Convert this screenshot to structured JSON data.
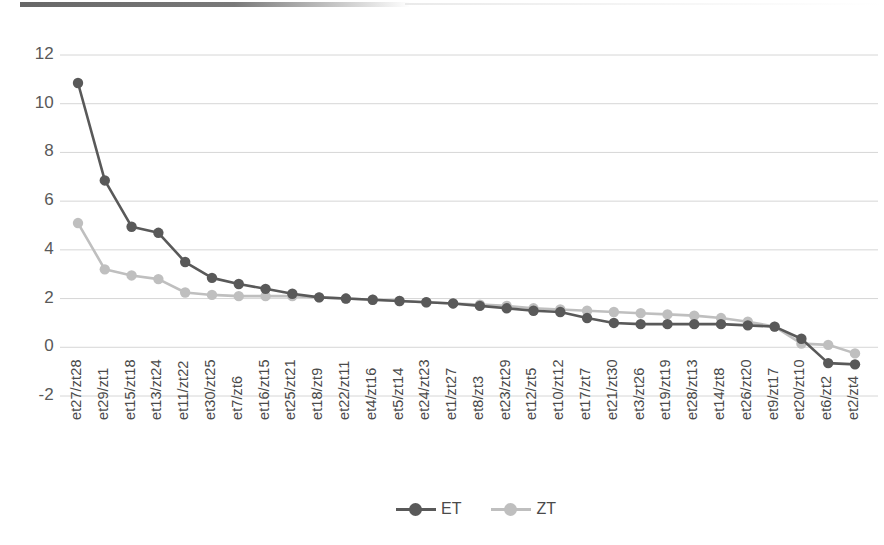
{
  "chart_data": {
    "type": "line",
    "title": "",
    "xlabel": "",
    "ylabel": "",
    "ylim": [
      -2,
      12
    ],
    "yticks": [
      12,
      10,
      8,
      6,
      4,
      2,
      0,
      -2
    ],
    "grid": true,
    "legend_position": "bottom",
    "categories": [
      "et27/zt28",
      "et29/zt1",
      "et15/zt18",
      "et13/zt24",
      "et11/zt22",
      "et30/zt25",
      "et7/zt6",
      "et16/zt15",
      "et25/zt21",
      "et18/zt9",
      "et22/zt11",
      "et4/zt16",
      "et5/zt14",
      "et24/zt23",
      "et1/zt27",
      "et8/zt3",
      "et23/zt29",
      "et12/zt5",
      "et10/zt12",
      "et17/zt7",
      "et21/zt30",
      "et3/zt26",
      "et19/zt19",
      "et28/zt13",
      "et14/zt8",
      "et26/zt20",
      "et9/zt17",
      "et20/zt10",
      "et6/zt2",
      "et2/zt4"
    ],
    "series": [
      {
        "name": "ET",
        "color": "#595959",
        "values": [
          10.85,
          6.85,
          4.95,
          4.7,
          3.5,
          2.85,
          2.6,
          2.4,
          2.2,
          2.05,
          2.0,
          1.95,
          1.9,
          1.85,
          1.8,
          1.7,
          1.6,
          1.5,
          1.45,
          1.2,
          1.0,
          0.95,
          0.95,
          0.95,
          0.95,
          0.9,
          0.85,
          0.35,
          -0.65,
          -0.7
        ]
      },
      {
        "name": "ZT",
        "color": "#bfbfbf",
        "values": [
          5.1,
          3.2,
          2.95,
          2.8,
          2.25,
          2.15,
          2.1,
          2.1,
          2.1,
          2.05,
          2.0,
          1.95,
          1.9,
          1.85,
          1.8,
          1.75,
          1.7,
          1.6,
          1.55,
          1.5,
          1.45,
          1.4,
          1.35,
          1.3,
          1.2,
          1.05,
          0.85,
          0.15,
          0.1,
          -0.25
        ]
      }
    ]
  },
  "legend": {
    "items": [
      {
        "label": "ET",
        "color": "#595959"
      },
      {
        "label": "ZT",
        "color": "#bfbfbf"
      }
    ]
  }
}
